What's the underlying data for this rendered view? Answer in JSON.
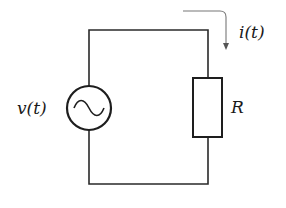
{
  "diagram": {
    "type": "circuit",
    "components": {
      "source": {
        "kind": "ac-voltage-source",
        "label": "v(t)"
      },
      "resistor": {
        "kind": "resistor",
        "label": "R"
      },
      "current": {
        "kind": "current-arrow",
        "label": "i(t)"
      }
    },
    "colors": {
      "wire": "#2a2a2a",
      "arrow": "#777777",
      "background": "#ffffff"
    }
  }
}
